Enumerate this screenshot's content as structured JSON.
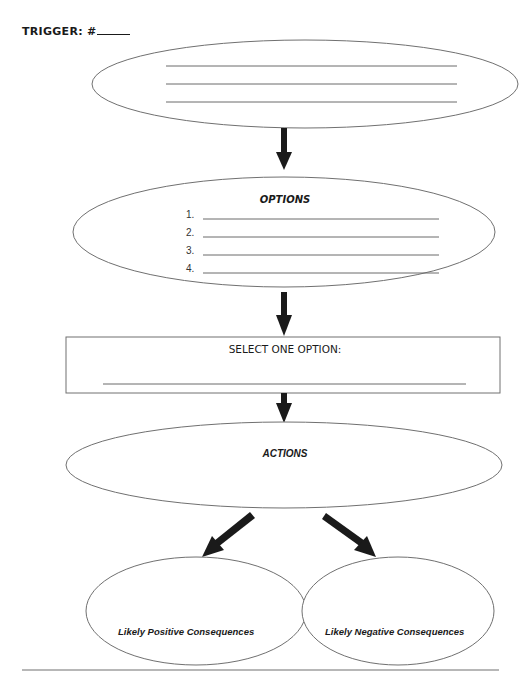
{
  "worksheet": {
    "trigger": {
      "label": "TRIGGER: #",
      "number_blank": ""
    },
    "trigger_ellipse": {
      "blank_lines": 3
    },
    "options": {
      "title": "OPTIONS",
      "items": [
        {
          "number": "1.",
          "value": ""
        },
        {
          "number": "2.",
          "value": ""
        },
        {
          "number": "3.",
          "value": ""
        },
        {
          "number": "4.",
          "value": ""
        }
      ]
    },
    "select": {
      "title": "SELECT ONE OPTION:",
      "value": ""
    },
    "actions": {
      "title": "ACTIONS"
    },
    "consequences": {
      "positive": "Likely Positive Consequences",
      "negative": "Likely Negative Consequences"
    }
  },
  "colors": {
    "outline": "#707070",
    "arrow": "#1a1a1a",
    "background": "#ffffff"
  }
}
